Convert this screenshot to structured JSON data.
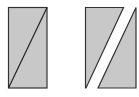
{
  "diagram": {
    "colors": {
      "fill": "#c8c8c8",
      "stroke": "#333333",
      "background": "#ffffff"
    },
    "shapes": [
      {
        "name": "whole-rectangle",
        "points": [
          [
            8,
            7
          ],
          [
            47,
            7
          ],
          [
            47,
            88
          ],
          [
            8,
            88
          ]
        ],
        "diagonal": [
          [
            47,
            7
          ],
          [
            8,
            88
          ]
        ]
      },
      {
        "name": "left-piece",
        "points": [
          [
            85,
            7
          ],
          [
            123,
            7
          ],
          [
            86,
            88
          ]
        ]
      },
      {
        "name": "right-piece",
        "points": [
          [
            136,
            7
          ],
          [
            136,
            88
          ],
          [
            98,
            88
          ]
        ]
      }
    ]
  }
}
